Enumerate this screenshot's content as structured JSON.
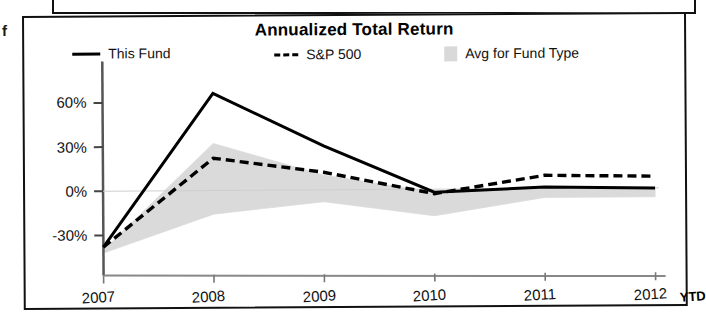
{
  "page": {
    "stray_margin_letter": "f"
  },
  "chart_panel": {
    "title": "Annualized Total Return",
    "legend": [
      {
        "key": "this_fund",
        "label": "This Fund",
        "marker": "solid-line-swatch",
        "color": "#000000"
      },
      {
        "key": "sp500",
        "label": "S&P 500",
        "marker": "dashed-line-swatch",
        "color": "#000000"
      },
      {
        "key": "avg_fund_type",
        "label": "Avg for Fund Type",
        "marker": "shaded-area-swatch",
        "color": "#d9d9d9"
      }
    ]
  },
  "chart_data": {
    "type": "line",
    "title": "Annualized Total Return",
    "xlabel": "",
    "ylabel": "",
    "categories": [
      "2007",
      "2008",
      "2009",
      "2010",
      "2011",
      "2012"
    ],
    "x_tick_suffix": "YTD",
    "x_tick_suffix_applies_to": "2012",
    "ylim": [
      -45,
      80
    ],
    "yticks": [
      -30,
      0,
      30,
      60
    ],
    "ytick_labels": [
      "-30%",
      "0%",
      "30%",
      "60%"
    ],
    "grid": false,
    "legend_position": "top",
    "series": [
      {
        "name": "This Fund",
        "style": "solid",
        "color": "#000000",
        "values": [
          -38,
          66,
          30,
          -2,
          1,
          0
        ]
      },
      {
        "name": "S&P 500",
        "style": "dashed",
        "color": "#000000",
        "values": [
          -38,
          22,
          12,
          -3,
          9,
          8
        ]
      }
    ],
    "band": {
      "name": "Avg for Fund Type",
      "style": "shaded-area",
      "color": "#d9d9d9",
      "upper": [
        -40,
        32,
        10,
        -2,
        1,
        0
      ],
      "lower": [
        -42,
        -16,
        -8,
        -18,
        -6,
        -6
      ]
    }
  }
}
